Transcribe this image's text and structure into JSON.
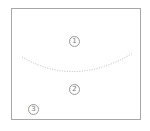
{
  "diagram": {
    "markers": [
      {
        "id": 1,
        "label": "1"
      },
      {
        "id": 2,
        "label": "2"
      },
      {
        "id": 3,
        "label": "3"
      }
    ],
    "curve": {
      "style": "dotted",
      "color": "#b0b0b0"
    },
    "border_color": "#a8a8a8"
  }
}
